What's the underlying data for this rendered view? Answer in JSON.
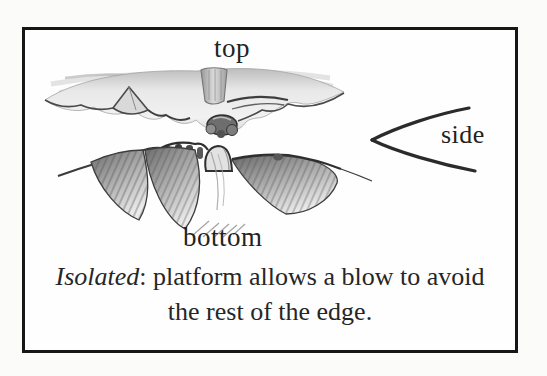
{
  "page": {
    "background": "#fbfbf9"
  },
  "figure": {
    "border_color": "#161616",
    "labels": {
      "top": "top",
      "side": "side",
      "bottom": "bottom"
    },
    "caption": {
      "term": "Isolated",
      "rest": ": platform allows a blow to avoid",
      "line2": "the rest of the edge."
    },
    "illustration": {
      "subject": "stone-edge-pencil-sketch",
      "ink_dark": "#2d2d2d",
      "ink_mid": "#8a8a8a",
      "ink_light": "#d8d8d8"
    }
  }
}
